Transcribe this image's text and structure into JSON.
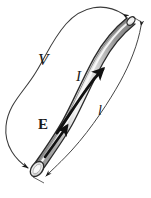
{
  "figure": {
    "background_color": "#ffffff",
    "ink_color": "#1a1a1a",
    "tube": {
      "fill_dark": "#8e8e8e",
      "fill_mid": "#b8b8b8",
      "highlight": "#f2f2f2",
      "outline": "#2b2b2b",
      "description": "shaded cylindrical tube curving from lower-left to upper-right"
    },
    "labels": [
      {
        "id": "voltage",
        "text": "V",
        "style": "italic",
        "meaning": "potential difference across the conductor"
      },
      {
        "id": "current",
        "text": "I",
        "style": "italic",
        "meaning": "current flowing through the conductor"
      },
      {
        "id": "field",
        "text": "E",
        "style": "bold",
        "meaning": "electric field vector inside the conductor"
      },
      {
        "id": "length",
        "text": "l",
        "style": "italic",
        "meaning": "length of the conductor"
      }
    ],
    "arrows": {
      "voltage_arc": "double-headed curve wrapping around the left side from the bottom end to the top end of the tube",
      "current_arrow": "thick arrow along the tube pointing up-right",
      "field_arrow": "thick arrow along the lower tube pointing up-right",
      "length_line": "thin double-headed dimension line parallel to the tube on the right"
    }
  }
}
